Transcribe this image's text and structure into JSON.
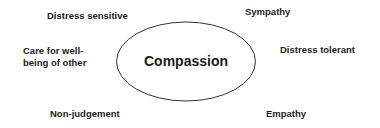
{
  "diagram": {
    "center": {
      "label": "Compassion",
      "shape": "ellipse",
      "stroke_color": "#333333"
    },
    "attributes": [
      {
        "id": "distress-sensitive",
        "label": "Distress sensitive",
        "position": "top-left"
      },
      {
        "id": "sympathy",
        "label": "Sympathy",
        "position": "top-right"
      },
      {
        "id": "care",
        "label_line1": "Care for well-",
        "label_line2": "being of other",
        "position": "left"
      },
      {
        "id": "distress-tolerant",
        "label": "Distress tolerant",
        "position": "right"
      },
      {
        "id": "non-judgement",
        "label": "Non-judgement",
        "position": "bottom-left"
      },
      {
        "id": "empathy",
        "label": "Empathy",
        "position": "bottom-right"
      }
    ]
  }
}
